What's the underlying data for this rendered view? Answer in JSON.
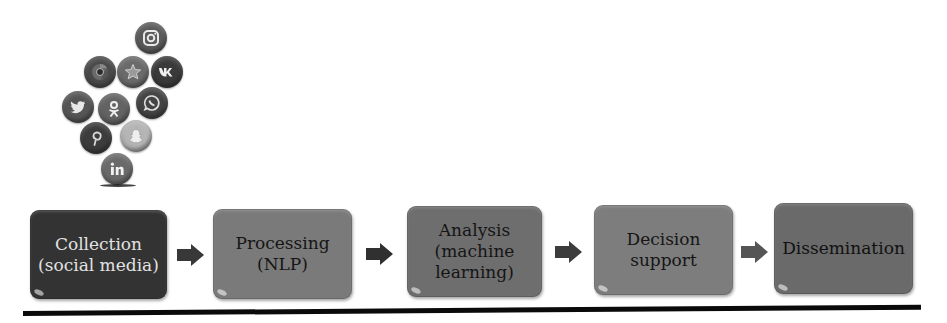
{
  "icon_cluster": {
    "label": "Social media platform icons",
    "icons": [
      {
        "name": "instagram",
        "x": 135,
        "y": 22,
        "color": "#5a5a5a"
      },
      {
        "name": "chrome",
        "x": 84,
        "y": 56,
        "color": "#4a4a4a"
      },
      {
        "name": "star-app",
        "x": 117,
        "y": 56,
        "color": "#6a6a6a"
      },
      {
        "name": "vk",
        "x": 151,
        "y": 56,
        "color": "#3a3a3a"
      },
      {
        "name": "twitter",
        "x": 62,
        "y": 91,
        "color": "#555555"
      },
      {
        "name": "odnoklassniki",
        "x": 98,
        "y": 93,
        "color": "#636363"
      },
      {
        "name": "whatsapp",
        "x": 136,
        "y": 87,
        "color": "#444444"
      },
      {
        "name": "pinterest",
        "x": 80,
        "y": 122,
        "color": "#3c3c3c"
      },
      {
        "name": "snapchat",
        "x": 120,
        "y": 120,
        "color": "#b5b5b5"
      },
      {
        "name": "linkedin",
        "x": 101,
        "y": 153,
        "color": "#6a6a6a"
      }
    ]
  },
  "stages": [
    {
      "label": "Collection\n(social media)",
      "x": 30,
      "y": 210,
      "w": 137,
      "h": 89,
      "bg": "#333333",
      "fg": "#e2e2e2"
    },
    {
      "label": "Processing\n(NLP)",
      "x": 213,
      "y": 209,
      "w": 139,
      "h": 90,
      "bg": "#7a7a7a",
      "fg": "#151515"
    },
    {
      "label": "Analysis\n(machine\nlearning)",
      "x": 407,
      "y": 206,
      "w": 135,
      "h": 91,
      "bg": "#6e6e6e",
      "fg": "#151515"
    },
    {
      "label": "Decision\nsupport",
      "x": 594,
      "y": 205,
      "w": 139,
      "h": 90,
      "bg": "#7d7d7d",
      "fg": "#151515"
    },
    {
      "label": "Dissemination",
      "x": 774,
      "y": 203,
      "w": 139,
      "h": 91,
      "bg": "#6a6a6a",
      "fg": "#111111"
    }
  ],
  "arrows": [
    {
      "x": 177,
      "y": 244,
      "color": "#383838"
    },
    {
      "x": 366,
      "y": 243,
      "color": "#303030"
    },
    {
      "x": 555,
      "y": 241,
      "color": "#3c3c3c"
    },
    {
      "x": 741,
      "y": 241,
      "color": "#555555"
    }
  ],
  "bottom_rule": {
    "color": "#0a0a0a"
  }
}
